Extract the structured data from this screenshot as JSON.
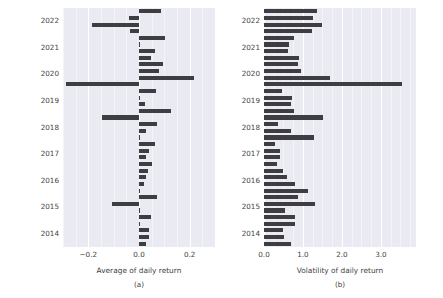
{
  "figure": {
    "background_color": "#ffffff",
    "axes_facecolor": "#eaeaf2",
    "bar_color": "#3e3e42",
    "grid_color": "#ffffff"
  },
  "panels": [
    {
      "id": "a",
      "caption": "(a)",
      "xlabel": "Average of daily return",
      "xticks": [
        "-0.2",
        "0.0",
        "0.2"
      ],
      "yticks": [
        "2022",
        "2021",
        "2020",
        "2019",
        "2018",
        "2017",
        "2016",
        "2015",
        "2014"
      ]
    },
    {
      "id": "b",
      "caption": "(b)",
      "xlabel": "Volatility of daily return",
      "xticks": [
        "0.0",
        "1.0",
        "2.0",
        "3.0"
      ],
      "yticks": [
        "2022",
        "2021",
        "2020",
        "2019",
        "2018",
        "2017",
        "2016",
        "2015",
        "2014"
      ]
    }
  ],
  "chart_data": [
    {
      "type": "bar",
      "orientation": "horizontal",
      "panel": "a",
      "title": "",
      "xlabel": "Average of daily return",
      "ylabel": "",
      "xlim": [
        -0.3,
        0.3
      ],
      "xticks": [
        -0.2,
        0.0,
        0.2
      ],
      "grid": true,
      "legend": "none",
      "categories": [
        "2022-Q4",
        "2022-Q3",
        "2022-Q2",
        "2022-Q1",
        "2021-Q4",
        "2021-Q3",
        "2021-Q2",
        "2021-Q1",
        "2020-Q4",
        "2020-Q3",
        "2020-Q2",
        "2020-Q1",
        "2019-Q4",
        "2019-Q3",
        "2019-Q2",
        "2019-Q1",
        "2018-Q4",
        "2018-Q3",
        "2018-Q2",
        "2018-Q1",
        "2017-Q4",
        "2017-Q3",
        "2017-Q2",
        "2017-Q1",
        "2016-Q4",
        "2016-Q3",
        "2016-Q2",
        "2016-Q1",
        "2015-Q4",
        "2015-Q3",
        "2015-Q2",
        "2015-Q1",
        "2014-Q4",
        "2014-Q3",
        "2014-Q2",
        "2014-Q1"
      ],
      "values": [
        0.086,
        -0.038,
        -0.184,
        -0.037,
        0.101,
        0.002,
        0.064,
        0.047,
        0.094,
        0.079,
        0.216,
        -0.29,
        0.066,
        0.005,
        0.023,
        0.128,
        -0.145,
        0.072,
        0.029,
        0.004,
        0.062,
        0.041,
        0.028,
        0.05,
        0.036,
        0.029,
        0.018,
        0.005,
        0.07,
        -0.106,
        0.004,
        0.049,
        0.004,
        0.041,
        0.041,
        0.029
      ]
    },
    {
      "type": "bar",
      "orientation": "horizontal",
      "panel": "b",
      "title": "",
      "xlabel": "Volatility of daily return",
      "ylabel": "",
      "xlim": [
        0.0,
        3.9
      ],
      "xticks": [
        0.0,
        1.0,
        2.0,
        3.0
      ],
      "grid": true,
      "legend": "none",
      "categories": [
        "2022-Q4",
        "2022-Q3",
        "2022-Q2",
        "2022-Q1",
        "2021-Q4",
        "2021-Q3",
        "2021-Q2",
        "2021-Q1",
        "2020-Q4",
        "2020-Q3",
        "2020-Q2",
        "2020-Q1",
        "2019-Q4",
        "2019-Q3",
        "2019-Q2",
        "2019-Q1",
        "2018-Q4",
        "2018-Q3",
        "2018-Q2",
        "2018-Q1",
        "2017-Q4",
        "2017-Q3",
        "2017-Q2",
        "2017-Q1",
        "2016-Q4",
        "2016-Q3",
        "2016-Q2",
        "2016-Q1",
        "2015-Q4",
        "2015-Q3",
        "2015-Q2",
        "2015-Q1",
        "2014-Q4",
        "2014-Q3",
        "2014-Q2",
        "2014-Q1"
      ],
      "values": [
        1.36,
        1.26,
        1.49,
        1.22,
        0.76,
        0.63,
        0.62,
        0.89,
        0.88,
        0.94,
        1.7,
        3.55,
        0.47,
        0.73,
        0.7,
        0.78,
        1.52,
        0.37,
        0.7,
        1.28,
        0.28,
        0.4,
        0.42,
        0.33,
        0.5,
        0.58,
        0.8,
        1.12,
        0.87,
        1.31,
        0.55,
        0.79,
        0.8,
        0.48,
        0.52,
        0.7
      ]
    }
  ]
}
